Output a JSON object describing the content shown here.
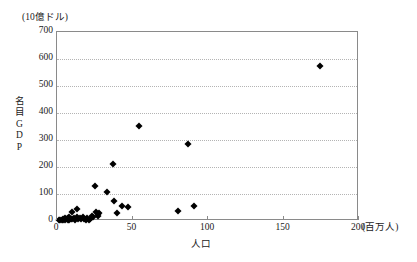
{
  "chart_data": {
    "type": "scatter",
    "title": "",
    "xlabel": "人口",
    "ylabel": "名目GDP",
    "x_unit": "(百万人)",
    "y_unit": "(10億ドル)",
    "xlim": [
      0,
      200
    ],
    "ylim": [
      0,
      700
    ],
    "x_ticks": [
      0,
      50,
      100,
      150,
      200
    ],
    "y_ticks": [
      0,
      100,
      200,
      300,
      400,
      500,
      600,
      700
    ],
    "grid": "horizontal-dotted",
    "legend": "none",
    "series": [
      {
        "name": "国別 人口と名目GDP",
        "points": [
          {
            "x": 1,
            "y": 3
          },
          {
            "x": 2,
            "y": 5
          },
          {
            "x": 3,
            "y": 4
          },
          {
            "x": 4,
            "y": 8
          },
          {
            "x": 4,
            "y": 2
          },
          {
            "x": 5,
            "y": 12
          },
          {
            "x": 5,
            "y": 4
          },
          {
            "x": 6,
            "y": 6
          },
          {
            "x": 7,
            "y": 10
          },
          {
            "x": 7,
            "y": 3
          },
          {
            "x": 8,
            "y": 16
          },
          {
            "x": 8,
            "y": 5
          },
          {
            "x": 9,
            "y": 9
          },
          {
            "x": 10,
            "y": 7
          },
          {
            "x": 10,
            "y": 33
          },
          {
            "x": 11,
            "y": 12
          },
          {
            "x": 12,
            "y": 5
          },
          {
            "x": 13,
            "y": 15
          },
          {
            "x": 13,
            "y": 45
          },
          {
            "x": 14,
            "y": 9
          },
          {
            "x": 15,
            "y": 11
          },
          {
            "x": 16,
            "y": 6
          },
          {
            "x": 17,
            "y": 13
          },
          {
            "x": 18,
            "y": 8
          },
          {
            "x": 19,
            "y": 5
          },
          {
            "x": 20,
            "y": 10
          },
          {
            "x": 21,
            "y": 4
          },
          {
            "x": 22,
            "y": 7
          },
          {
            "x": 23,
            "y": 20
          },
          {
            "x": 24,
            "y": 14
          },
          {
            "x": 25,
            "y": 128
          },
          {
            "x": 26,
            "y": 33
          },
          {
            "x": 27,
            "y": 25
          },
          {
            "x": 27,
            "y": 18
          },
          {
            "x": 28,
            "y": 30
          },
          {
            "x": 33,
            "y": 108
          },
          {
            "x": 37,
            "y": 210
          },
          {
            "x": 38,
            "y": 74
          },
          {
            "x": 40,
            "y": 28
          },
          {
            "x": 43,
            "y": 57
          },
          {
            "x": 47,
            "y": 52
          },
          {
            "x": 54,
            "y": 352
          },
          {
            "x": 80,
            "y": 38
          },
          {
            "x": 87,
            "y": 285
          },
          {
            "x": 91,
            "y": 55
          },
          {
            "x": 174,
            "y": 575
          }
        ]
      }
    ]
  },
  "axes": {
    "y_unit_label": "(10億ドル)",
    "y_title_chars": [
      "名",
      "目",
      "G",
      "D",
      "P"
    ],
    "x_unit_label": "(百万人)",
    "x_title_label": "人口",
    "y_tick_labels": [
      "700",
      "600",
      "500",
      "400",
      "300",
      "200",
      "100",
      "0"
    ],
    "x_tick_labels": [
      "0",
      "50",
      "100",
      "150",
      "200"
    ]
  },
  "colors": {
    "marker": "#000000",
    "frame": "#8a8a8a",
    "gridline": "#b4b4b4",
    "background": "#ffffff",
    "text": "#1a1a1a"
  }
}
